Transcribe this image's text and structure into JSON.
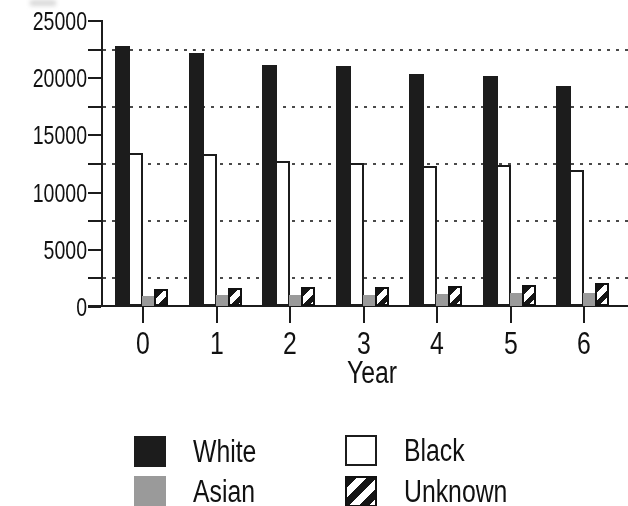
{
  "chart_data": {
    "type": "bar",
    "xlabel": "Year",
    "ylabel": "",
    "categories": [
      "0",
      "1",
      "2",
      "3",
      "4",
      "5",
      "6"
    ],
    "series": [
      {
        "name": "White",
        "style": "solid-black",
        "values": [
          22700,
          22100,
          21100,
          21000,
          20300,
          20100,
          19200
        ]
      },
      {
        "name": "Black",
        "style": "outline-white",
        "values": [
          13400,
          13300,
          12700,
          12500,
          12200,
          12300,
          11900
        ]
      },
      {
        "name": "Asian",
        "style": "solid-gray",
        "values": [
          900,
          950,
          1000,
          1000,
          1050,
          1100,
          1100
        ]
      },
      {
        "name": "Unknown",
        "style": "hatch-diagonal",
        "values": [
          1500,
          1600,
          1650,
          1700,
          1750,
          1850,
          2000
        ]
      }
    ],
    "ylim": [
      0,
      25000
    ],
    "ytick_step": 5000,
    "ytick_labels": [
      "0",
      "5000",
      "10000",
      "15000",
      "20000",
      "25000"
    ],
    "yminor_tick_step": 2500,
    "gridlines": "horizontal dotted at 2500, 7500, 12500, 17500, 22500",
    "legend_position": "bottom two-column"
  },
  "legend": {
    "items": [
      {
        "label": "White",
        "swatch": "solid-black"
      },
      {
        "label": "Black",
        "swatch": "outline-white"
      },
      {
        "label": "Asian",
        "swatch": "solid-gray"
      },
      {
        "label": "Unknown",
        "swatch": "hatch-diagonal"
      }
    ]
  },
  "colors": {
    "bar_black": "#1c1c1c",
    "bar_gray": "#9a9a9a",
    "bar_white": "#ffffff",
    "outline": "#1c1c1c",
    "grid_dots": "#4a4a4a",
    "text": "#111111",
    "background": "#ffffff"
  }
}
